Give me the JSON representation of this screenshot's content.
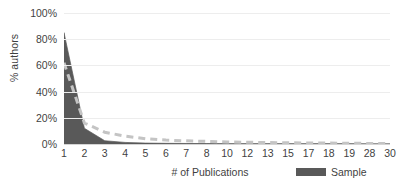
{
  "chart_data": {
    "type": "area",
    "title": "",
    "xlabel": "# of Publications",
    "ylabel": "% authors",
    "categories": [
      "1",
      "2",
      "3",
      "4",
      "5",
      "6",
      "7",
      "8",
      "10",
      "12",
      "13",
      "15",
      "17",
      "18",
      "19",
      "28",
      "30"
    ],
    "ylim": [
      0,
      100
    ],
    "y_ticks": [
      "0%",
      "20%",
      "40%",
      "60%",
      "80%",
      "100%"
    ],
    "y_tick_values": [
      0,
      20,
      40,
      60,
      80,
      100
    ],
    "grid": true,
    "grid_axis": "y",
    "legend_position": "bottom-right",
    "series": [
      {
        "name": "Sample",
        "style": "area",
        "color": "#595959",
        "values": [
          85,
          12,
          2.5,
          1.2,
          0.7,
          0.5,
          0.4,
          0.3,
          0.2,
          0.2,
          0.15,
          0.1,
          0.1,
          0.1,
          0.1,
          0.05,
          0.05
        ]
      },
      {
        "name": "",
        "style": "dashed-line",
        "color": "#c4c4c4",
        "values": [
          62,
          16,
          9,
          6,
          4,
          3,
          2.4,
          2,
          1.6,
          1.3,
          1.1,
          0.9,
          0.8,
          0.7,
          0.6,
          0.4,
          0.3
        ]
      }
    ],
    "legend": [
      {
        "label": "Sample",
        "color": "#595959",
        "marker": "rect"
      }
    ]
  },
  "colors": {
    "sample_fill": "#595959",
    "dashed_line": "#c4c4c4",
    "gridline": "#ededed",
    "axis": "#d4d4d4",
    "text": "#3f3f3f",
    "background": "#ffffff"
  }
}
